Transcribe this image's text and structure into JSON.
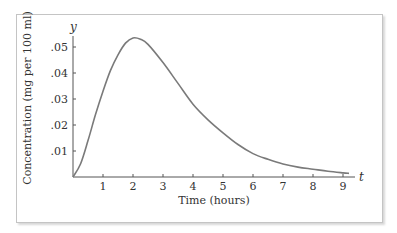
{
  "chart_data": {
    "type": "line",
    "title": "",
    "xlabel": "Time (hours)",
    "ylabel": "Concentration (mg per 100 ml)",
    "x_axis_var": "t",
    "y_axis_var": "y",
    "xlim": [
      0,
      9.5
    ],
    "ylim": [
      0,
      0.058
    ],
    "x_ticks": [
      "1",
      "2",
      "3",
      "4",
      "5",
      "6",
      "7",
      "8",
      "9"
    ],
    "y_ticks": [
      ".01",
      ".02",
      ".03",
      ".04",
      ".05"
    ],
    "grid": false,
    "legend": null,
    "series": [
      {
        "name": "Concentration",
        "x": [
          0,
          0.25,
          0.5,
          0.75,
          1,
          1.25,
          1.5,
          1.75,
          2,
          2.25,
          2.5,
          3,
          3.5,
          4,
          4.5,
          5,
          5.5,
          6,
          6.5,
          7,
          7.5,
          8,
          8.5,
          9,
          9.2
        ],
        "y": [
          0,
          0.005,
          0.014,
          0.024,
          0.033,
          0.041,
          0.047,
          0.0515,
          0.0535,
          0.053,
          0.051,
          0.044,
          0.036,
          0.028,
          0.022,
          0.017,
          0.0125,
          0.009,
          0.0068,
          0.005,
          0.0038,
          0.003,
          0.0022,
          0.0016,
          0.0014
        ]
      }
    ]
  }
}
